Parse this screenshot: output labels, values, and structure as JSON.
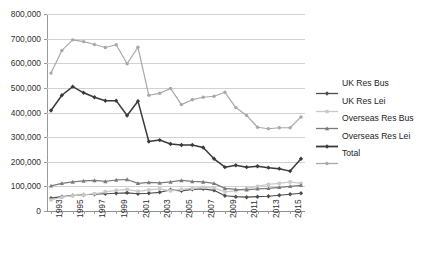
{
  "chart_data": {
    "type": "line",
    "title": "",
    "xlabel": "",
    "ylabel": "",
    "ylim": [
      0,
      800000
    ],
    "ytick_values": [
      0,
      100000,
      200000,
      300000,
      400000,
      500000,
      600000,
      700000,
      800000
    ],
    "ytick_labels": [
      "0",
      "100,000",
      "200,000",
      "300,000",
      "400,000",
      "500,000",
      "600,000",
      "700,000",
      "800,000"
    ],
    "grid": true,
    "legend_position": "right",
    "x": [
      1993,
      1994,
      1995,
      1996,
      1997,
      1998,
      1999,
      2000,
      2001,
      2002,
      2003,
      2004,
      2005,
      2006,
      2007,
      2008,
      2009,
      2010,
      2011,
      2012,
      2013,
      2014,
      2015,
      2016
    ],
    "xtick_labels": [
      "1993",
      "",
      "1995",
      "",
      "1997",
      "",
      "1999",
      "",
      "2001",
      "",
      "2003",
      "",
      "2005",
      "",
      "2007",
      "",
      "2009",
      "",
      "2011",
      "",
      "2013",
      "",
      "2015",
      ""
    ],
    "series": [
      {
        "name": "UK Res Bus",
        "color": "#4d4d4d",
        "marker": "diamond",
        "values": [
          52000,
          58000,
          63000,
          66000,
          68000,
          70000,
          72000,
          74000,
          70000,
          72000,
          76000,
          86000,
          82000,
          88000,
          90000,
          84000,
          62000,
          58000,
          56000,
          58000,
          60000,
          64000,
          68000,
          72000
        ]
      },
      {
        "name": "UK Res Lei",
        "color": "#c9c9c9",
        "marker": "square",
        "values": [
          45000,
          56000,
          62000,
          66000,
          70000,
          78000,
          84000,
          88000,
          80000,
          86000,
          90000,
          82000,
          88000,
          92000,
          96000,
          94000,
          78000,
          82000,
          92000,
          100000,
          108000,
          112000,
          118000,
          112000
        ]
      },
      {
        "name": "Overseas Res Bus",
        "color": "#7a7a7a",
        "marker": "triangle",
        "values": [
          102000,
          112000,
          118000,
          122000,
          124000,
          120000,
          126000,
          128000,
          112000,
          116000,
          114000,
          118000,
          124000,
          120000,
          118000,
          112000,
          92000,
          88000,
          86000,
          90000,
          92000,
          96000,
          100000,
          104000
        ]
      },
      {
        "name": "Overseas Res Lei",
        "color": "#3a3a3a",
        "marker": "diamond",
        "values": [
          408000,
          470000,
          505000,
          480000,
          462000,
          448000,
          448000,
          388000,
          446000,
          282000,
          288000,
          272000,
          268000,
          268000,
          258000,
          212000,
          178000,
          186000,
          178000,
          182000,
          176000,
          172000,
          162000,
          212000
        ]
      },
      {
        "name": "Total",
        "color": "#a8a8a8",
        "marker": "circle",
        "values": [
          560000,
          652000,
          695000,
          688000,
          676000,
          664000,
          675000,
          598000,
          665000,
          470000,
          478000,
          498000,
          432000,
          452000,
          462000,
          466000,
          482000,
          420000,
          388000,
          340000,
          334000,
          338000,
          338000,
          382000
        ]
      }
    ]
  },
  "legend": {
    "items": [
      {
        "label": "UK Res Bus"
      },
      {
        "label": "UK Res Lei"
      },
      {
        "label": "Overseas Res Bus"
      },
      {
        "label": "Overseas Res Lei"
      },
      {
        "label": "Total"
      }
    ]
  }
}
